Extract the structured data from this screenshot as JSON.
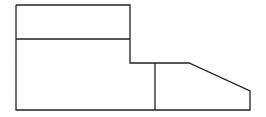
{
  "diagram": {
    "type": "line-drawing",
    "stroke_color": "#222222",
    "background_color": "#ffffff",
    "outline_points": [
      [
        16,
        5
      ],
      [
        130,
        5
      ],
      [
        130,
        63
      ],
      [
        189,
        63
      ],
      [
        250,
        91
      ],
      [
        250,
        110
      ],
      [
        16,
        110
      ]
    ],
    "inner_lines": [
      {
        "name": "top-divider",
        "x1": 16,
        "y1": 39,
        "x2": 130,
        "y2": 39
      },
      {
        "name": "vertical-divider",
        "x1": 155,
        "y1": 63,
        "x2": 155,
        "y2": 110
      }
    ]
  }
}
